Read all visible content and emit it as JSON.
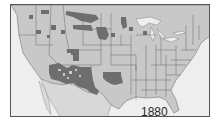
{
  "map": {
    "title": "Native American reservations",
    "year_label": "1880",
    "colors": {
      "ocean": "#eeeeee",
      "land": "#c8c8c8",
      "border": "#606060",
      "reservation": "#6e6e6e",
      "frame": "#555555",
      "label": "#2a2a2a"
    },
    "legend": []
  }
}
